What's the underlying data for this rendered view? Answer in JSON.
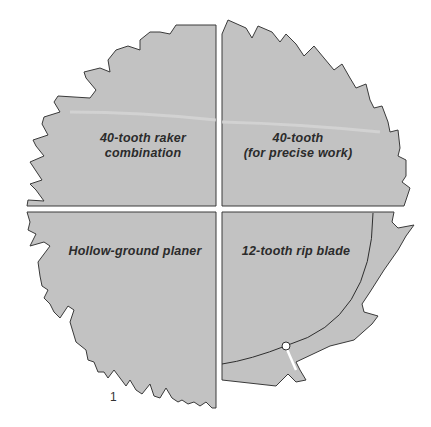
{
  "figure": {
    "number": "1",
    "colors": {
      "blade_fill": "#c2c2c2",
      "outline": "#3a3a3a",
      "background": "#ffffff",
      "text": "#2b2b2b"
    },
    "quadrants": [
      {
        "id": "top-left",
        "line1": "40-tooth raker",
        "line2": "combination"
      },
      {
        "id": "top-right",
        "line1": "40-tooth",
        "line2": "(for precise work)"
      },
      {
        "id": "bottom-left",
        "line1": "Hollow-ground planer",
        "line2": ""
      },
      {
        "id": "bottom-right",
        "line1": "12-tooth rip blade",
        "line2": ""
      }
    ]
  }
}
